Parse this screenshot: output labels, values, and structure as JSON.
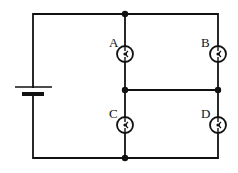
{
  "diagram": {
    "type": "circuit",
    "stroke_color": "#111111",
    "background": "#ffffff",
    "components": {
      "battery": {
        "label": ""
      },
      "bulbs": [
        {
          "id": "A",
          "label": "A"
        },
        {
          "id": "B",
          "label": "B"
        },
        {
          "id": "C",
          "label": "C"
        },
        {
          "id": "D",
          "label": "D"
        }
      ]
    },
    "junctions": [
      "top-middle",
      "middle-left",
      "middle-right",
      "bottom-middle"
    ]
  }
}
